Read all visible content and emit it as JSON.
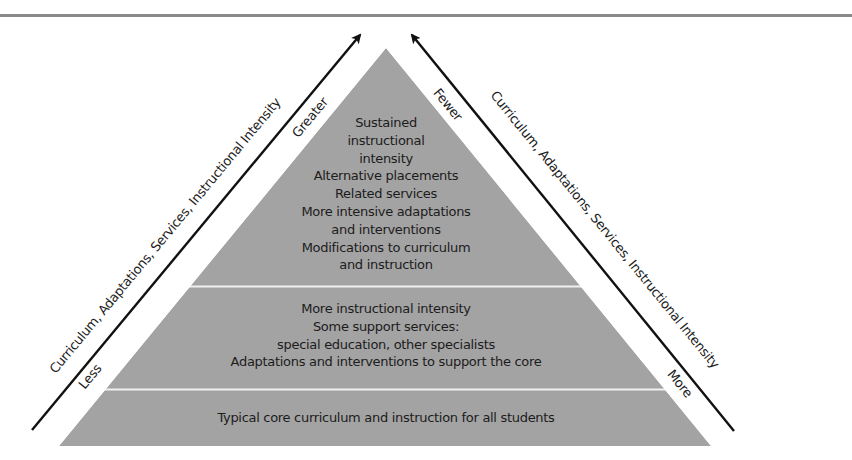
{
  "diagram": {
    "type": "pyramid",
    "colors": {
      "pyramid_fill": "#a3a3a3",
      "separator": "#f2f2f2",
      "arrow": "#111111",
      "rule": "#8a8a8a"
    },
    "tiers": [
      {
        "level": "top",
        "lines": [
          "Sustained",
          "instructional",
          "intensity",
          "Alternative placements",
          "Related services",
          "More intensive adaptations",
          "and interventions",
          "Modifications to curriculum",
          "and instruction"
        ]
      },
      {
        "level": "middle",
        "lines": [
          "More instructional intensity",
          "Some support services:",
          "special education, other specialists",
          "Adaptations and interventions to support the core"
        ]
      },
      {
        "level": "bottom",
        "lines": [
          "Typical core curriculum and instruction for all students"
        ]
      }
    ],
    "left_axis": {
      "label": "Curriculum, Adaptations, Services, Instructional Intensity",
      "low_label": "Less",
      "high_label": "Greater"
    },
    "right_axis": {
      "label": "Curriculum, Adaptations, Services, Instructional Intensity",
      "low_label": "More",
      "high_label": "Fewer"
    }
  }
}
